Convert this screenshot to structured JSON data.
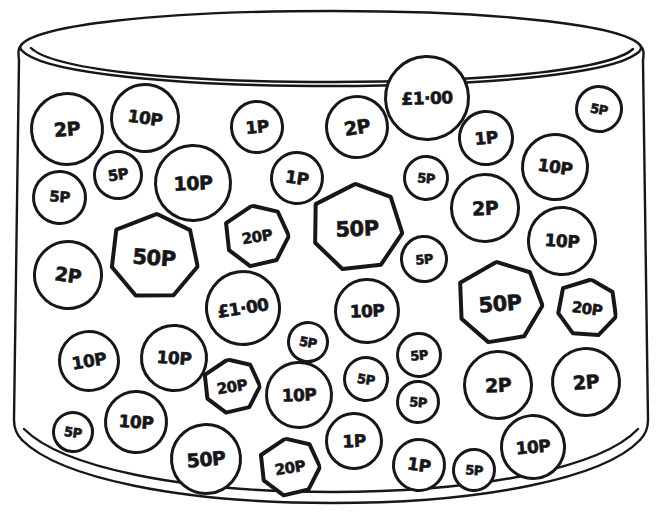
{
  "scene": {
    "title": "Jar of coins",
    "container_name": "coin-jar",
    "ink_color": "#17171a",
    "background_color": "#ffffff",
    "style": "hand-drawn line illustration"
  },
  "coins": [
    {
      "id": "c01",
      "label": "2P",
      "shape": "round",
      "x": 30,
      "y": 92,
      "d": 74,
      "size": "l",
      "tilt": "tilt-a"
    },
    {
      "id": "c02",
      "label": "10P",
      "shape": "round",
      "x": 110,
      "y": 83,
      "d": 70,
      "size": "m",
      "tilt": "tilt-d"
    },
    {
      "id": "c03",
      "label": "5P",
      "shape": "round",
      "x": 93,
      "y": 150,
      "d": 50,
      "size": "s",
      "tilt": "tilt-c"
    },
    {
      "id": "c04",
      "label": "5P",
      "shape": "round",
      "x": 32,
      "y": 170,
      "d": 55,
      "size": "s",
      "tilt": "tilt-b"
    },
    {
      "id": "c05",
      "label": "10P",
      "shape": "round",
      "x": 154,
      "y": 144,
      "d": 78,
      "size": "l",
      "tilt": "tilt-e"
    },
    {
      "id": "c06",
      "label": "1P",
      "shape": "round",
      "x": 230,
      "y": 100,
      "d": 54,
      "size": "m",
      "tilt": "tilt-a"
    },
    {
      "id": "c07",
      "label": "1P",
      "shape": "round",
      "x": 270,
      "y": 151,
      "d": 54,
      "size": "m",
      "tilt": "tilt-d"
    },
    {
      "id": "c08",
      "label": "2P",
      "shape": "round",
      "x": 325,
      "y": 95,
      "d": 64,
      "size": "l",
      "tilt": "tilt-c"
    },
    {
      "id": "c09",
      "label": "£1·00",
      "shape": "round",
      "x": 384,
      "y": 55,
      "d": 86,
      "size": "p1",
      "tilt": "tilt-e"
    },
    {
      "id": "c10",
      "label": "5P",
      "shape": "round",
      "x": 403,
      "y": 155,
      "d": 46,
      "size": "xs",
      "tilt": "tilt-b"
    },
    {
      "id": "c11",
      "label": "1P",
      "shape": "round",
      "x": 458,
      "y": 110,
      "d": 56,
      "size": "m",
      "tilt": "tilt-a"
    },
    {
      "id": "c12",
      "label": "5P",
      "shape": "round",
      "x": 575,
      "y": 85,
      "d": 48,
      "size": "xs",
      "tilt": "tilt-f"
    },
    {
      "id": "c13",
      "label": "10P",
      "shape": "round",
      "x": 521,
      "y": 133,
      "d": 68,
      "size": "m",
      "tilt": "tilt-d"
    },
    {
      "id": "c14",
      "label": "2P",
      "shape": "round",
      "x": 450,
      "y": 173,
      "d": 70,
      "size": "l",
      "tilt": "tilt-e"
    },
    {
      "id": "c15",
      "label": "10P",
      "shape": "round",
      "x": 527,
      "y": 206,
      "d": 70,
      "size": "m",
      "tilt": "tilt-b"
    },
    {
      "id": "c16",
      "label": "20P",
      "shape": "hept",
      "x": 224,
      "y": 204,
      "d": 66,
      "size": "s",
      "tilt": "tilt-c"
    },
    {
      "id": "c17",
      "label": "50P",
      "shape": "hept",
      "x": 310,
      "y": 182,
      "d": 94,
      "size": "xl",
      "tilt": "tilt-e"
    },
    {
      "id": "c18",
      "label": "5P",
      "shape": "round",
      "x": 400,
      "y": 235,
      "d": 48,
      "size": "xs",
      "tilt": "tilt-a"
    },
    {
      "id": "c19",
      "label": "50P",
      "shape": "hept",
      "x": 108,
      "y": 212,
      "d": 92,
      "size": "xl",
      "tilt": "tilt-b"
    },
    {
      "id": "c20",
      "label": "2P",
      "shape": "round",
      "x": 33,
      "y": 240,
      "d": 70,
      "size": "l",
      "tilt": "tilt-d"
    },
    {
      "id": "c21",
      "label": "£1·00",
      "shape": "round",
      "x": 205,
      "y": 270,
      "d": 76,
      "size": "p1",
      "tilt": "tilt-c"
    },
    {
      "id": "c22",
      "label": "10P",
      "shape": "round",
      "x": 334,
      "y": 278,
      "d": 66,
      "size": "m",
      "tilt": "tilt-e"
    },
    {
      "id": "c23",
      "label": "50P",
      "shape": "hept",
      "x": 456,
      "y": 260,
      "d": 88,
      "size": "xl",
      "tilt": "tilt-a"
    },
    {
      "id": "c24",
      "label": "20P",
      "shape": "hept",
      "x": 556,
      "y": 278,
      "d": 62,
      "size": "s",
      "tilt": "tilt-d"
    },
    {
      "id": "c25",
      "label": "10P",
      "shape": "round",
      "x": 140,
      "y": 324,
      "d": 68,
      "size": "m",
      "tilt": "tilt-b"
    },
    {
      "id": "c26",
      "label": "10P",
      "shape": "round",
      "x": 58,
      "y": 330,
      "d": 62,
      "size": "m",
      "tilt": "tilt-c"
    },
    {
      "id": "c27",
      "label": "5P",
      "shape": "round",
      "x": 287,
      "y": 321,
      "d": 42,
      "size": "xs",
      "tilt": "tilt-f"
    },
    {
      "id": "c28",
      "label": "5P",
      "shape": "round",
      "x": 396,
      "y": 332,
      "d": 46,
      "size": "xs",
      "tilt": "tilt-a"
    },
    {
      "id": "c29",
      "label": "5P",
      "shape": "round",
      "x": 343,
      "y": 356,
      "d": 46,
      "size": "xs",
      "tilt": "tilt-d"
    },
    {
      "id": "c30",
      "label": "5P",
      "shape": "round",
      "x": 396,
      "y": 380,
      "d": 44,
      "size": "xs",
      "tilt": "tilt-b"
    },
    {
      "id": "c31",
      "label": "2P",
      "shape": "round",
      "x": 463,
      "y": 350,
      "d": 70,
      "size": "l",
      "tilt": "tilt-e"
    },
    {
      "id": "c32",
      "label": "2P",
      "shape": "round",
      "x": 551,
      "y": 347,
      "d": 70,
      "size": "l",
      "tilt": "tilt-a"
    },
    {
      "id": "c33",
      "label": "20P",
      "shape": "hept",
      "x": 203,
      "y": 358,
      "d": 58,
      "size": "s",
      "tilt": "tilt-c"
    },
    {
      "id": "c34",
      "label": "10P",
      "shape": "round",
      "x": 265,
      "y": 361,
      "d": 68,
      "size": "m",
      "tilt": "tilt-e"
    },
    {
      "id": "c35",
      "label": "5P",
      "shape": "round",
      "x": 52,
      "y": 411,
      "d": 42,
      "size": "xs",
      "tilt": "tilt-d"
    },
    {
      "id": "c36",
      "label": "10P",
      "shape": "round",
      "x": 104,
      "y": 390,
      "d": 64,
      "size": "m",
      "tilt": "tilt-b"
    },
    {
      "id": "c37",
      "label": "50P",
      "shape": "round",
      "x": 170,
      "y": 423,
      "d": 72,
      "size": "l",
      "tilt": "tilt-a"
    },
    {
      "id": "c38",
      "label": "20P",
      "shape": "hept",
      "x": 259,
      "y": 437,
      "d": 62,
      "size": "s",
      "tilt": "tilt-c"
    },
    {
      "id": "c39",
      "label": "1P",
      "shape": "round",
      "x": 325,
      "y": 412,
      "d": 58,
      "size": "m",
      "tilt": "tilt-e"
    },
    {
      "id": "c40",
      "label": "1P",
      "shape": "round",
      "x": 392,
      "y": 438,
      "d": 54,
      "size": "m",
      "tilt": "tilt-d"
    },
    {
      "id": "c41",
      "label": "5P",
      "shape": "round",
      "x": 452,
      "y": 448,
      "d": 44,
      "size": "xs",
      "tilt": "tilt-b"
    },
    {
      "id": "c42",
      "label": "10P",
      "shape": "round",
      "x": 500,
      "y": 414,
      "d": 66,
      "size": "m",
      "tilt": "tilt-a"
    }
  ],
  "chart_data": {
    "type": "table",
    "categories": [
      "1P",
      "2P",
      "5P",
      "10P",
      "20P",
      "50P",
      "£1·00"
    ],
    "values": [
      4,
      6,
      11,
      11,
      4,
      4,
      2
    ],
    "xlabel": "Coin denomination",
    "ylabel": "Count"
  }
}
